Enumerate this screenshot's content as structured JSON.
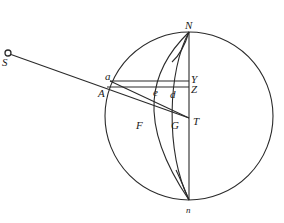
{
  "diagram": {
    "type": "geometric-figure",
    "stroke_color": "#2a2a2a",
    "background": "#ffffff",
    "labels": {
      "S": "S",
      "N": "N",
      "n": "n",
      "a": "a",
      "A": "A",
      "Y": "Y",
      "Z": "Z",
      "e": "e",
      "d": "d",
      "F": "F",
      "G": "G",
      "T": "T"
    },
    "elements": [
      "great circle centered near T",
      "vertical diameter Nn through Y, Z, T",
      "small circle marker at S",
      "line from S through A to T",
      "line from a to T",
      "horizontal chord aY",
      "horizontal chord AZ",
      "curve N-e-F-n",
      "curve N-d-G-n"
    ]
  }
}
